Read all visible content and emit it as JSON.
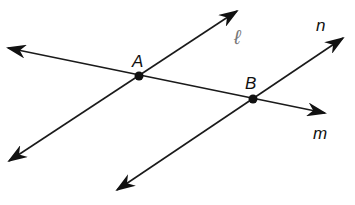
{
  "diagram": {
    "type": "geometry-lines",
    "colors": {
      "stroke": "#1a1a1a",
      "background": "#ffffff"
    },
    "lines": [
      {
        "name": "l",
        "label": "ℓ",
        "from": [
          9,
          161
        ],
        "to": [
          237,
          11
        ],
        "through": "A"
      },
      {
        "name": "m",
        "label": "m",
        "from": [
          8,
          48
        ],
        "to": [
          325,
          113
        ],
        "through": [
          "A",
          "B"
        ]
      },
      {
        "name": "n",
        "label": "n",
        "from": [
          117,
          190
        ],
        "to": [
          343,
          38
        ],
        "through": "B"
      }
    ],
    "points": [
      {
        "name": "A",
        "label": "A",
        "x": 139,
        "y": 76
      },
      {
        "name": "B",
        "label": "B",
        "x": 253,
        "y": 99
      }
    ],
    "labels": {
      "point_a": "A",
      "point_b": "B",
      "line_l": "ℓ",
      "line_m": "m",
      "line_n": "n"
    }
  }
}
